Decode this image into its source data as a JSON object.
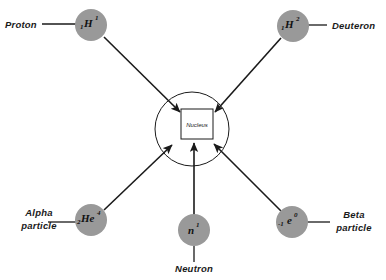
{
  "diagram": {
    "background_color": "#ffffff",
    "particle_fill": "#999999",
    "line_color": "#1a1a1a",
    "center": {
      "label": "Nucleus",
      "ring_cx": 192,
      "ring_cy": 129,
      "ring_r": 37,
      "box_x": 181,
      "box_y": 109,
      "box_w": 32,
      "box_h": 30
    },
    "particles": [
      {
        "key": "proton",
        "label": "Proton",
        "symbol_sub": "1",
        "symbol_main": "H",
        "symbol_sup": "1",
        "cx": 91,
        "cy": 25,
        "r": 16,
        "label_x": 5,
        "label_y": 28,
        "label_anchor": "start",
        "leader": {
          "x1": 42,
          "y1": 24,
          "x2": 76,
          "y2": 24
        },
        "beam": {
          "x1": 104,
          "y1": 37,
          "x2": 180,
          "y2": 112
        }
      },
      {
        "key": "deuteron",
        "label": "Deuteron",
        "symbol_sub": "1",
        "symbol_main": "H",
        "symbol_sup": "2",
        "cx": 293,
        "cy": 26,
        "r": 16,
        "label_x": 332,
        "label_y": 29,
        "label_anchor": "start",
        "leader": {
          "x1": 308,
          "y1": 25,
          "x2": 327,
          "y2": 25
        },
        "beam": {
          "x1": 281,
          "y1": 38,
          "x2": 215,
          "y2": 112
        }
      },
      {
        "key": "alpha-particle",
        "label_line1": "Alpha",
        "label_line2": "particle",
        "symbol_sub": "2",
        "symbol_main": "He",
        "symbol_sup": "4",
        "cx": 91,
        "cy": 220,
        "r": 16,
        "label_x": 39,
        "label_y1": 216,
        "label_y2": 229,
        "label_anchor": "middle",
        "leader": {
          "x1": 48,
          "y1": 222,
          "x2": 76,
          "y2": 222
        },
        "beam": {
          "x1": 104,
          "y1": 210,
          "x2": 172,
          "y2": 145
        }
      },
      {
        "key": "neutron",
        "label": "Neutron",
        "symbol_sub": "",
        "symbol_main": "n",
        "symbol_sup": "1",
        "cx": 194,
        "cy": 230,
        "r": 16,
        "label_x": 194,
        "label_y": 272,
        "label_anchor": "middle",
        "leader": {
          "x1": 194,
          "y1": 246,
          "x2": 194,
          "y2": 262
        },
        "beam": {
          "x1": 194,
          "y1": 222,
          "x2": 194,
          "y2": 143
        }
      },
      {
        "key": "beta-particle",
        "label_line1": "Beta",
        "label_line2": "particle",
        "symbol_sub": "-1",
        "symbol_main": "e",
        "symbol_sup": "0",
        "cx": 292,
        "cy": 222,
        "r": 16,
        "label_x": 354,
        "label_y1": 218,
        "label_y2": 231,
        "label_anchor": "middle",
        "leader": {
          "x1": 307,
          "y1": 222,
          "x2": 330,
          "y2": 222
        },
        "beam": {
          "x1": 281,
          "y1": 211,
          "x2": 214,
          "y2": 144
        }
      }
    ]
  }
}
